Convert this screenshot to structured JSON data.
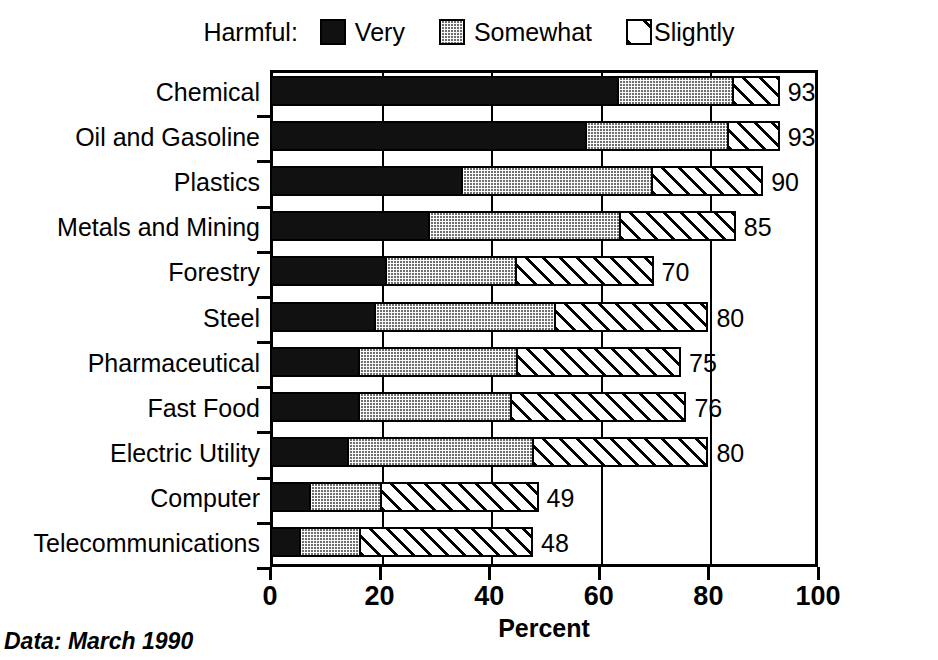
{
  "legend": {
    "title": "Harmful:",
    "entries": [
      {
        "label": "Very",
        "icon": "solid-black-swatch-icon",
        "color": "#111111"
      },
      {
        "label": "Somewhat",
        "icon": "stippled-gray-swatch-icon",
        "color": "#6f6f6f"
      },
      {
        "label": "Slightly",
        "icon": "diagonal-hatch-swatch-icon",
        "color": "#ffffff"
      }
    ]
  },
  "footnote": "Data:  March 1990",
  "chart_data": {
    "type": "bar",
    "orientation": "horizontal",
    "stacked": true,
    "title": "",
    "xlabel": "Percent",
    "ylabel": "",
    "xlim": [
      0,
      100
    ],
    "xticks": [
      0,
      20,
      40,
      60,
      80,
      100
    ],
    "grid": true,
    "legend_position": "top",
    "categories": [
      "Chemical",
      "Oil and Gasoline",
      "Plastics",
      "Metals and Mining",
      "Forestry",
      "Steel",
      "Pharmaceutical",
      "Fast Food",
      "Electric Utility",
      "Computer",
      "Telecommunications"
    ],
    "series": [
      {
        "name": "Very",
        "values": [
          64,
          58,
          35,
          29,
          21,
          19,
          16,
          16,
          14,
          7,
          5
        ]
      },
      {
        "name": "Somewhat",
        "values": [
          21,
          26,
          35,
          35,
          24,
          33,
          29,
          28,
          34,
          13,
          11
        ]
      },
      {
        "name": "Slightly",
        "values": [
          8,
          9,
          20,
          21,
          25,
          28,
          30,
          32,
          32,
          29,
          32
        ]
      }
    ],
    "totals": [
      93,
      93,
      90,
      85,
      70,
      80,
      75,
      76,
      80,
      49,
      48
    ],
    "total_labels": [
      "93",
      "93",
      "90",
      "85",
      "70",
      "80",
      "75",
      "76",
      "80",
      "49",
      "48"
    ]
  }
}
